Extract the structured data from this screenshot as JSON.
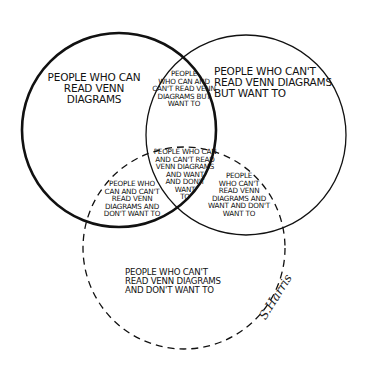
{
  "diagram": {
    "type": "venn",
    "sets": [
      {
        "id": "can_read",
        "description": "Can read Venn diagrams",
        "stroke": "solid-thick"
      },
      {
        "id": "want_to",
        "description": "Want to read Venn diagrams",
        "stroke": "solid-thin"
      },
      {
        "id": "dont_want_to",
        "description": "Don't want to read Venn diagrams",
        "stroke": "dashed"
      }
    ],
    "colors": {
      "ink": "#111111",
      "background": "#ffffff"
    },
    "regions": {
      "left_only": "People who can\nread Venn diagrams",
      "left_right": "People\nwho can and\ncan't read Venn\ndiagrams but\nwant to",
      "right_only": "People who can't\nread Venn diagrams\nbut want to",
      "center": "People who can\nand can't read\nVenn diagrams\nand want\nand don't\nwant\nto",
      "left_bottom": "People who\ncan and can't\nread Venn\ndiagrams and\ndon't want to",
      "right_bottom": "People\nwho can't\nread Venn\ndiagrams and\nwant and don't\nwant to",
      "bottom_only": "People who can't\nread Venn diagrams\nand don't want to"
    },
    "signature": "S.Harris"
  }
}
